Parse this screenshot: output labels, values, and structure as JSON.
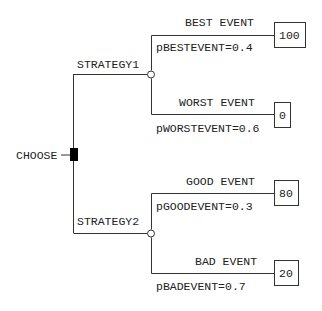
{
  "tree": {
    "decision_node": {
      "label": "CHOOSE",
      "color": "#000000"
    },
    "strategies": [
      {
        "label": "STRATEGY1",
        "events": [
          {
            "label": "BEST EVENT",
            "probability_label": "pBESTEVENT=0.4",
            "payoff": "100"
          },
          {
            "label": "WORST EVENT",
            "probability_label": "pWORSTEVENT=0.6",
            "payoff": "0"
          }
        ]
      },
      {
        "label": "STRATEGY2",
        "events": [
          {
            "label": "GOOD EVENT",
            "probability_label": "pGOODEVENT=0.3",
            "payoff": "80"
          },
          {
            "label": "BAD EVENT",
            "probability_label": "pBADEVENT=0.7",
            "payoff": "20"
          }
        ]
      }
    ]
  }
}
